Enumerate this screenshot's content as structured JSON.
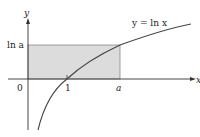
{
  "diagram": {
    "curve_label": "y = ln x",
    "axis_labels": {
      "x": "x",
      "y": "y"
    },
    "tick_labels": {
      "origin": "0",
      "one": "1",
      "a": "a",
      "ln_a": "ln a"
    },
    "colors": {
      "rect_fill": "#dcdcdc",
      "rect_stroke": "#888888",
      "axis": "#333333",
      "curve": "#444444"
    }
  }
}
